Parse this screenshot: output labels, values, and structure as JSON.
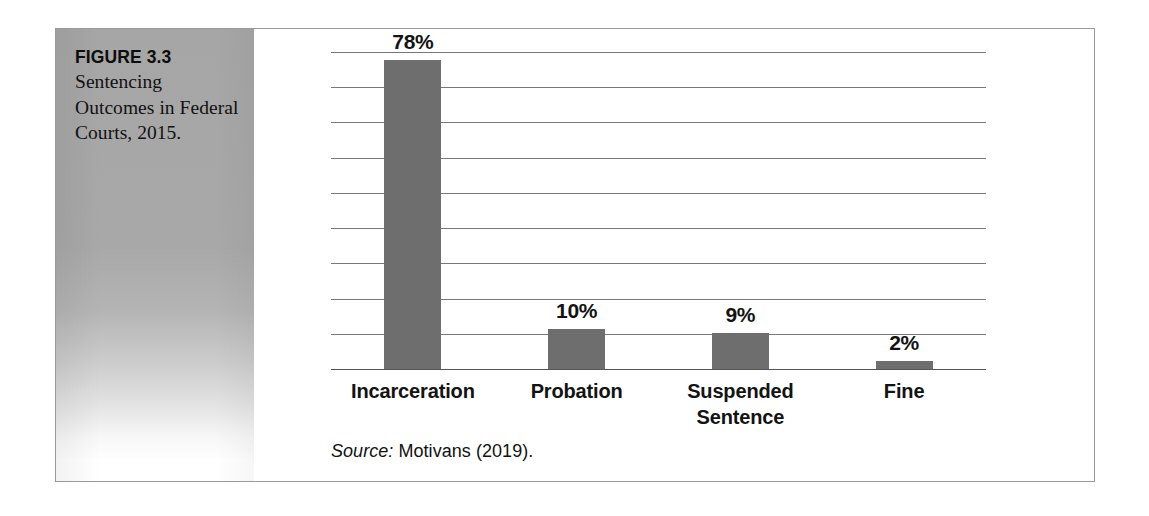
{
  "figure": {
    "number": "FIGURE 3.3",
    "title": "Sentencing Outcomes in Federal Courts, 2015.",
    "source_label": "Source:",
    "source_text": " Motivans (2019)."
  },
  "colors": {
    "bar": "#6e6e6e",
    "gridline": "#6d6d6d",
    "panel": "#a6a6a6",
    "frame_border": "#9a9a9a",
    "text": "#131313"
  },
  "chart_data": {
    "type": "bar",
    "title": "Sentencing Outcomes in Federal Courts, 2015.",
    "xlabel": "",
    "ylabel": "",
    "ylim": [
      0,
      80
    ],
    "grid": true,
    "gridline_count": 10,
    "legend": "none",
    "categories": [
      "Incarceration",
      "Probation",
      "Suspended Sentence",
      "Fine"
    ],
    "values": [
      78,
      10,
      9,
      2
    ],
    "value_labels": [
      "78%",
      "10%",
      "9%",
      "2%"
    ],
    "source": "Source: Motivans (2019)."
  },
  "bleed_text": [
    {
      "text": "sentences for",
      "left": 272,
      "top": 38
    },
    {
      "text": "are later reduced on appeal.",
      "left": 268,
      "top": 62
    },
    {
      "text": "the overall",
      "left": 274,
      "top": 88
    },
    {
      "text": "sentencing in federal",
      "left": 270,
      "top": 112
    },
    {
      "text": "court systems as well",
      "left": 276,
      "top": 136
    },
    {
      "text": "a number of",
      "left": 84,
      "top": 222
    },
    {
      "text": "for certain types",
      "left": 80,
      "top": 248
    },
    {
      "text": "of offenses. The",
      "left": 86,
      "top": 274
    },
    {
      "text": "practice of parole",
      "left": 82,
      "top": 300
    },
    {
      "text": "may also be eliminated",
      "left": 78,
      "top": 326
    },
    {
      "text": "in favor of the",
      "left": 88,
      "top": 352
    },
    {
      "text": "under the guidelines the number",
      "left": 520,
      "top": 300
    },
    {
      "text": "without the possibility of parole",
      "left": 560,
      "top": 326
    },
    {
      "text": "parole may be eliminated",
      "left": 600,
      "top": 352
    },
    {
      "text": "it relates to",
      "left": 660,
      "top": 378
    },
    {
      "text": "sentencing reform",
      "left": 700,
      "top": 96
    },
    {
      "text": "determinate",
      "left": 760,
      "top": 140
    },
    {
      "text": "guideline sentences",
      "left": 500,
      "top": 212
    },
    {
      "text": "a judge may",
      "left": 900,
      "top": 248
    },
    {
      "text": "have discretion",
      "left": 880,
      "top": 436
    }
  ]
}
